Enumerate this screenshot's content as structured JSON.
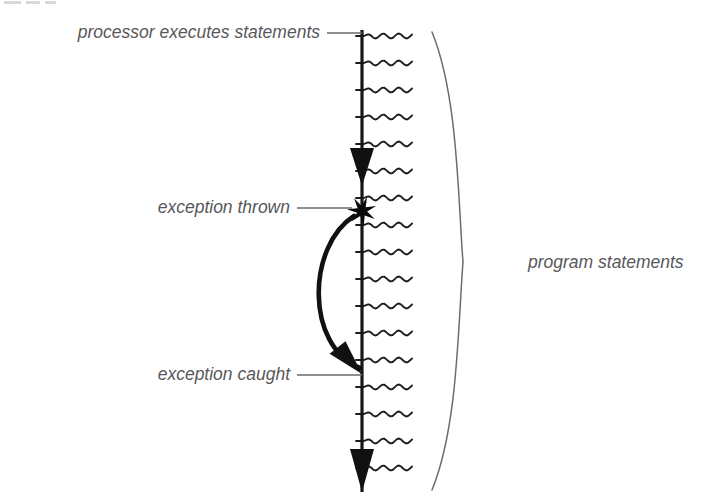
{
  "diagram": {
    "background_color": "#ffffff",
    "labels": {
      "processor_executes": "processor executes statements",
      "exception_thrown": "exception thrown",
      "exception_caught": "exception caught",
      "program_statements": "program statements"
    },
    "label_color": "#58585a",
    "ink_color": "#111114",
    "brace_color": "#6d6d70",
    "execution_line": {
      "x": 362,
      "y_top": 30,
      "y_bottom": 492,
      "color": "#17171a"
    },
    "statement_lines": {
      "count": 17,
      "x_start": 356,
      "x_end": 412,
      "y_first": 36,
      "y_spacing": 27,
      "style": "squiggle"
    },
    "flow_arrowheads": [
      {
        "name": "upper-execution-arrow",
        "x": 362,
        "y_tip": 186,
        "y_base": 148,
        "half_width": 12
      },
      {
        "name": "lower-execution-arrow",
        "x": 362,
        "y_tip": 492,
        "y_base": 449,
        "half_width": 12
      }
    ],
    "exception_star": {
      "center_x": 362,
      "center_y": 211,
      "outer_radius": 15,
      "inner_radius": 5.2,
      "points": 7
    },
    "exception_curve": {
      "start_x": 354,
      "start_y": 216,
      "bow_x": 303,
      "end_x": 360,
      "end_y": 368,
      "arrow_angle_deg": 52
    },
    "brace": {
      "x_outer": 432,
      "x_tip": 463,
      "y_top": 32,
      "y_mid": 262,
      "y_bottom": 490
    },
    "leaders": [
      {
        "name": "processor-leader",
        "x_start": 327,
        "x_end": 362,
        "y": 33
      },
      {
        "name": "thrown-leader",
        "x_start": 297,
        "x_end": 352,
        "y": 208
      },
      {
        "name": "caught-leader",
        "x_start": 297,
        "x_end": 362,
        "y": 375
      }
    ],
    "label_positions": {
      "processor_executes": {
        "x": 320,
        "y": 33
      },
      "exception_thrown": {
        "x": 290,
        "y": 208
      },
      "exception_caught": {
        "x": 290,
        "y": 375
      },
      "program_statements": {
        "x": 528,
        "y": 263
      }
    }
  }
}
